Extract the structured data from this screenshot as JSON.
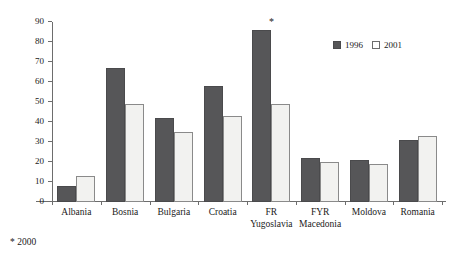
{
  "chart_data": {
    "type": "bar",
    "title": "",
    "subtitle": "",
    "xlabel": "",
    "ylabel": "",
    "ylim": [
      0,
      90
    ],
    "yticks": [
      0,
      10,
      20,
      30,
      40,
      50,
      60,
      70,
      80,
      90
    ],
    "grid": false,
    "legend_position": "top-right",
    "categories": [
      "Albania",
      "Bosnia",
      "Bulgaria",
      "Croatia",
      "FR Yugoslavia",
      "FYR Macedonia",
      "Moldova",
      "Romania"
    ],
    "category_lines": [
      {
        "line1": "Albania",
        "line2": ""
      },
      {
        "line1": "Bosnia",
        "line2": ""
      },
      {
        "line1": "Bulgaria",
        "line2": ""
      },
      {
        "line1": "Croatia",
        "line2": ""
      },
      {
        "line1": "FR",
        "line2": "Yugoslavia"
      },
      {
        "line1": "FYR",
        "line2": "Macedonia"
      },
      {
        "line1": "Moldova",
        "line2": ""
      },
      {
        "line1": "Romania",
        "line2": ""
      }
    ],
    "series": [
      {
        "name": "1996",
        "color": "#565658",
        "values": [
          8,
          67,
          42,
          58,
          86,
          22,
          21,
          31
        ]
      },
      {
        "name": "2001",
        "color": "#f2f2f0",
        "values": [
          13,
          49,
          35,
          43,
          49,
          20,
          19,
          33
        ]
      }
    ],
    "annotations": [
      {
        "text": "*",
        "category": "FR Yugoslavia",
        "series": "1996",
        "meaning": "2000"
      }
    ]
  },
  "legend": {
    "items": [
      {
        "label": "1996"
      },
      {
        "label": "2001"
      }
    ]
  },
  "footnote": {
    "text": "* 2000"
  }
}
